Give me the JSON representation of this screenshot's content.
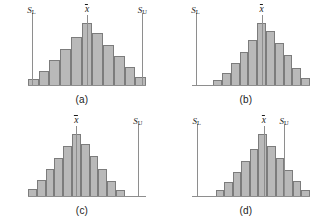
{
  "figure": {
    "background_color": "#ffffff",
    "bar_fill_color": "#b9b9b9",
    "bar_stroke_color": "#7c7c7c",
    "line_color": "#8e8e8e",
    "text_color": "#1a1a1a"
  },
  "labels": {
    "lower_spec": "S",
    "lower_spec_sub": "L",
    "upper_spec": "S",
    "upper_spec_sub": "U",
    "mean": "x"
  },
  "chart_data": [
    {
      "type": "bar",
      "panel": "a",
      "caption": "(a)",
      "title": "Process centered and within both specification limits",
      "xlabel": "",
      "ylabel": "",
      "categories": [
        "1",
        "2",
        "3",
        "4",
        "5",
        "6",
        "7",
        "8",
        "9",
        "10",
        "11"
      ],
      "values": [
        6,
        14,
        25,
        36,
        48,
        62,
        52,
        40,
        29,
        18,
        8
      ],
      "ylim": [
        0,
        64
      ],
      "grid": false,
      "legend": "none",
      "annotations": [
        {
          "name": "lower-spec-limit",
          "label": "S_L",
          "x_fraction": 0.0,
          "visible": true
        },
        {
          "name": "process-mean",
          "label": "x-bar",
          "x_fraction": 0.5,
          "visible": true
        },
        {
          "name": "upper-spec-limit",
          "label": "S_U",
          "x_fraction": 1.0,
          "visible": true
        }
      ]
    },
    {
      "type": "bar",
      "panel": "b",
      "caption": "(b)",
      "title": "Process shifted right, exceeding the upper specification limit",
      "xlabel": "",
      "ylabel": "",
      "categories": [
        "1",
        "2",
        "3",
        "4",
        "5",
        "6",
        "7",
        "8",
        "9",
        "10",
        "11"
      ],
      "values": [
        5,
        12,
        22,
        33,
        45,
        62,
        54,
        42,
        30,
        17,
        7
      ],
      "ylim": [
        0,
        64
      ],
      "grid": false,
      "legend": "none",
      "annotations": [
        {
          "name": "lower-spec-limit",
          "label": "S_L",
          "x_fraction": 0.0,
          "visible": true
        },
        {
          "name": "process-mean",
          "label": "x-bar",
          "x_fraction": 0.5,
          "visible": true
        },
        {
          "name": "upper-spec-limit",
          "label": "S_U",
          "x_fraction": 1.0,
          "visible": false
        }
      ]
    },
    {
      "type": "bar",
      "panel": "c",
      "caption": "(c)",
      "title": "Process shifted left, exceeding the lower specification limit",
      "xlabel": "",
      "ylabel": "",
      "categories": [
        "1",
        "2",
        "3",
        "4",
        "5",
        "6",
        "7",
        "8",
        "9",
        "10",
        "11"
      ],
      "values": [
        7,
        16,
        27,
        38,
        50,
        62,
        52,
        40,
        27,
        15,
        6
      ],
      "ylim": [
        0,
        64
      ],
      "grid": false,
      "legend": "none",
      "annotations": [
        {
          "name": "lower-spec-limit",
          "label": "S_L",
          "x_fraction": 0.0,
          "visible": false
        },
        {
          "name": "process-mean",
          "label": "x-bar",
          "x_fraction": 0.5,
          "visible": true
        },
        {
          "name": "upper-spec-limit",
          "label": "S_U",
          "x_fraction": 1.0,
          "visible": true
        }
      ]
    },
    {
      "type": "bar",
      "panel": "d",
      "caption": "(d)",
      "title": "Process mean within limits but spread exceeds the upper specification limit",
      "xlabel": "",
      "ylabel": "",
      "categories": [
        "1",
        "2",
        "3",
        "4",
        "5",
        "6",
        "7",
        "8",
        "9",
        "10",
        "11"
      ],
      "values": [
        6,
        14,
        24,
        35,
        47,
        62,
        50,
        38,
        26,
        15,
        6
      ],
      "ylim": [
        0,
        64
      ],
      "grid": false,
      "legend": "none",
      "annotations": [
        {
          "name": "lower-spec-limit",
          "label": "S_L",
          "x_fraction": 0.0,
          "visible": true
        },
        {
          "name": "process-mean",
          "label": "x-bar",
          "x_fraction": 0.5,
          "visible": true
        },
        {
          "name": "upper-spec-limit",
          "label": "S_U",
          "x_fraction": 1.0,
          "visible": true
        }
      ]
    }
  ],
  "panels": {
    "a": {
      "caption": "(a)",
      "bars_left_pct": 0,
      "bars_width_pct": 100,
      "spec_lower_pct": 3,
      "spec_upper_pct": 97,
      "mean_pct": 50,
      "show_lower": true,
      "show_upper": true
    },
    "b": {
      "caption": "(b)",
      "bars_left_pct": 18,
      "bars_width_pct": 82,
      "spec_lower_pct": 3,
      "spec_upper_pct": 97,
      "mean_pct": 59,
      "show_lower": true,
      "show_upper": false
    },
    "c": {
      "caption": "(c)",
      "bars_left_pct": 0,
      "bars_width_pct": 82,
      "spec_lower_pct": 3,
      "spec_upper_pct": 93,
      "mean_pct": 41,
      "show_lower": false,
      "show_upper": true
    },
    "d": {
      "caption": "(d)",
      "bars_left_pct": 20,
      "bars_width_pct": 80,
      "spec_lower_pct": 4,
      "spec_upper_pct": 78,
      "mean_pct": 61,
      "show_lower": true,
      "show_upper": true
    }
  }
}
